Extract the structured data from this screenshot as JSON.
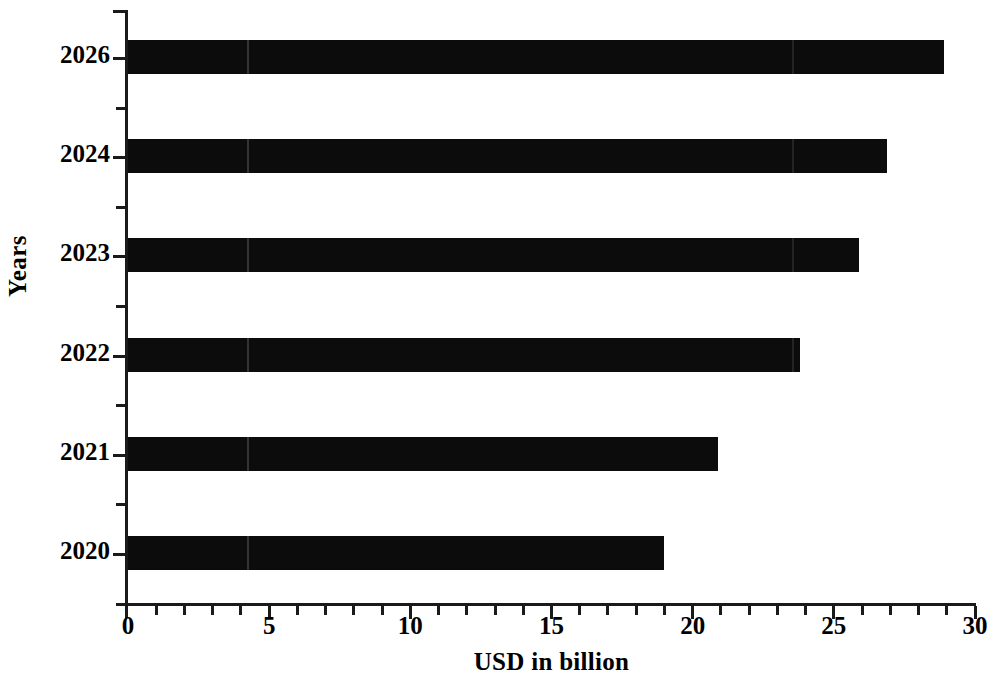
{
  "chart_data": {
    "type": "bar",
    "orientation": "horizontal",
    "title": "",
    "subtitle": "",
    "xlabel": "USD in billion",
    "ylabel": "Years",
    "categories": [
      "2026",
      "2024",
      "2023",
      "2022",
      "2021",
      "2020"
    ],
    "values": [
      28.9,
      26.9,
      25.9,
      23.8,
      20.9,
      19.0
    ],
    "series": [
      {
        "name": "USD in billion",
        "values": [
          28.9,
          26.9,
          25.9,
          23.8,
          20.9,
          19.0
        ]
      }
    ],
    "xlim": [
      0,
      30
    ],
    "x_major_ticks": [
      0,
      5,
      10,
      15,
      20,
      25,
      30
    ],
    "x_major_tick_labels": [
      "0",
      "5",
      "10",
      "15",
      "20",
      "25",
      "30"
    ],
    "x_minor_tick_interval": 1,
    "grid": false,
    "legend": false,
    "legend_position": "none",
    "bar_color": "#0c0c0c",
    "axis_color": "#1a1a1a",
    "background_color": "#ffffff"
  },
  "axes": {
    "y_title": "Years",
    "x_title": "USD in billion"
  }
}
